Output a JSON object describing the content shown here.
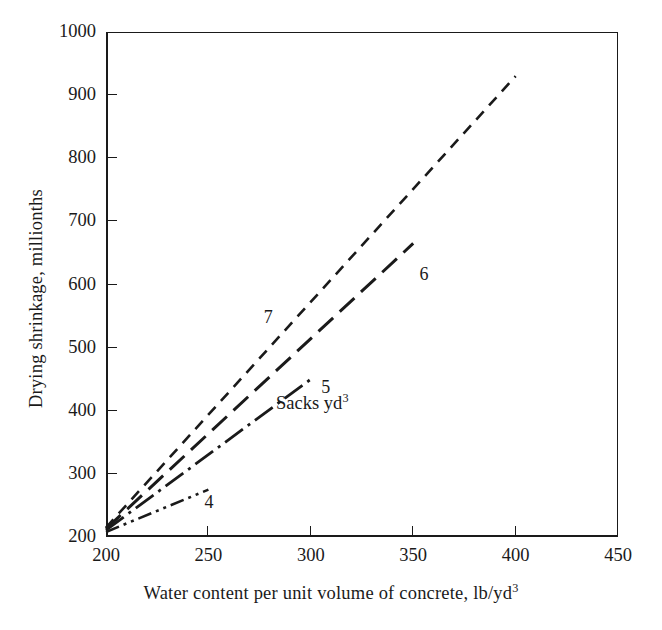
{
  "chart_data": {
    "type": "line",
    "title": "",
    "xlabel": "Water content per unit volume of concrete, lb/yd3",
    "xlabel_main": "Water content per unit volume of concrete, lb/yd",
    "xlabel_sup": "3",
    "ylabel": "Drying shrinkage, millionths",
    "xlim": [
      200,
      450
    ],
    "ylim": [
      200,
      1000
    ],
    "xticks": [
      200,
      250,
      300,
      350,
      400,
      450
    ],
    "yticks": [
      200,
      300,
      400,
      500,
      600,
      700,
      800,
      900,
      1000
    ],
    "xtick_labels": [
      "200",
      "250",
      "300",
      "350",
      "400",
      "450"
    ],
    "ytick_labels": [
      "200",
      "300",
      "400",
      "500",
      "600",
      "700",
      "800",
      "900",
      "1000"
    ],
    "grid": false,
    "legend_position": "inline-end-of-line",
    "annotations": [
      {
        "text": "Sacks yd",
        "sup": "3",
        "x": 285,
        "y": 412
      }
    ],
    "series": [
      {
        "name": "4",
        "label": "4",
        "dash_style": "dash-dot-dot",
        "stroke": "#1a1a1a",
        "stroke_width": 2.6,
        "dasharray": "14,5,3,5,3,5",
        "points": [
          [
            200,
            208
          ],
          [
            250,
            275
          ]
        ],
        "label_x": 250,
        "label_y": 256
      },
      {
        "name": "5",
        "label": "5",
        "dash_style": "dash-dot",
        "stroke": "#1a1a1a",
        "stroke_width": 2.8,
        "dasharray": "22,6,3,6",
        "points": [
          [
            200,
            211
          ],
          [
            300,
            450
          ]
        ],
        "label_x": 307,
        "label_y": 438
      },
      {
        "name": "6",
        "label": "6",
        "dash_style": "long-dash",
        "stroke": "#1a1a1a",
        "stroke_width": 3.0,
        "dasharray": "20,9",
        "points": [
          [
            200,
            213
          ],
          [
            350,
            665
          ]
        ],
        "label_x": 355,
        "label_y": 617
      },
      {
        "name": "7",
        "label": "7",
        "dash_style": "short-dash",
        "stroke": "#1a1a1a",
        "stroke_width": 2.6,
        "dasharray": "11,8",
        "points": [
          [
            200,
            215
          ],
          [
            400,
            930
          ]
        ],
        "label_x": 279,
        "label_y": 548
      }
    ]
  },
  "figure": {
    "background": "#ffffff",
    "axis_color": "#1a1a1a"
  }
}
